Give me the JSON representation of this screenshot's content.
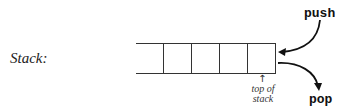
{
  "diagram": {
    "label": "Stack:",
    "cells": [
      "",
      "",
      "",
      "",
      ""
    ],
    "push_label": "push",
    "pop_label": "pop",
    "top_label_line1": "top of",
    "top_label_line2": "stack",
    "up_arrow": "↑"
  }
}
